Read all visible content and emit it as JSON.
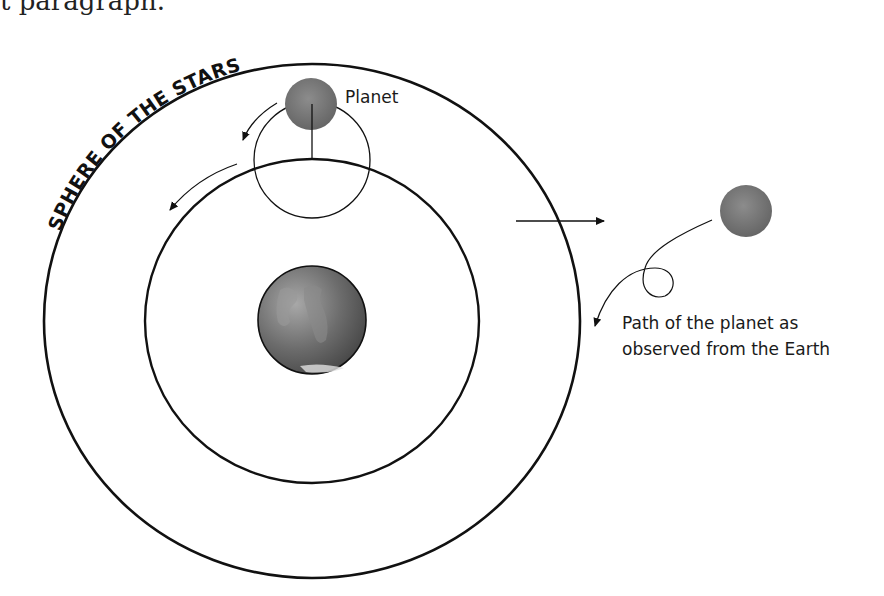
{
  "page": {
    "top_text_fragment": "t paragraph."
  },
  "diagram": {
    "sphere_label": "SPHERE OF THE STARS",
    "planet_label": "Planet",
    "path_label_line1": "Path of the planet as",
    "path_label_line2": "observed from the Earth",
    "elements": {
      "outer_sphere": {
        "cx": 312,
        "cy": 321,
        "rx": 268,
        "ry": 257
      },
      "deferent": {
        "cx": 312,
        "cy": 321,
        "rx": 167,
        "ry": 162
      },
      "epicycle": {
        "cx": 312,
        "cy": 160,
        "r": 58
      },
      "planet_on_epicycle": {
        "cx": 311,
        "cy": 104,
        "r": 26
      },
      "earth": {
        "cx": 312,
        "cy": 320,
        "r": 54
      },
      "observed_planet": {
        "cx": 746,
        "cy": 211,
        "r": 26
      }
    },
    "colors": {
      "line": "#111111",
      "planet_fill": "#7a7a7a",
      "earth_fill": "#6e6e6e",
      "background": "#ffffff"
    }
  }
}
